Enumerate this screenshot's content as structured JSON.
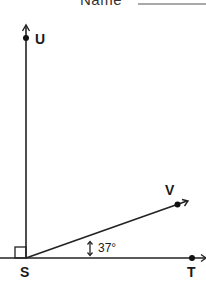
{
  "header": {
    "name_label": "Name",
    "name_blank": ""
  },
  "diagram": {
    "points": {
      "U": {
        "label": "U"
      },
      "S": {
        "label": "S"
      },
      "T": {
        "label": "T"
      },
      "V": {
        "label": "V"
      }
    },
    "rays": [
      "SU",
      "ST",
      "SV"
    ],
    "right_angle_marker": "angle UST",
    "angle_VST": "37°"
  }
}
